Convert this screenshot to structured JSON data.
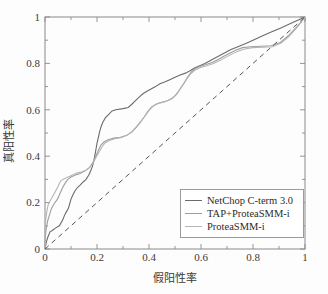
{
  "chart_data": {
    "type": "line",
    "title": "",
    "xlabel": "假阳性率",
    "ylabel": "真阳性率",
    "xlim": [
      0,
      1
    ],
    "ylim": [
      0,
      1
    ],
    "xticks": [
      "0",
      "0.2",
      "0.4",
      "0.6",
      "0.8",
      "1"
    ],
    "xtick_values": [
      0,
      0.2,
      0.4,
      0.6,
      0.8,
      1
    ],
    "yticks": [
      "0",
      "0.2",
      "0.4",
      "0.6",
      "0.8",
      "1"
    ],
    "ytick_values": [
      0,
      0.2,
      0.4,
      0.6,
      0.8,
      1
    ],
    "grid": false,
    "legend_position": "lower-right",
    "series": [
      {
        "name": "NetChop C-term 3.0",
        "color": "#6b6b6b",
        "style": "solid",
        "points": [
          [
            0.0,
            0.0
          ],
          [
            0.005,
            0.03
          ],
          [
            0.012,
            0.055
          ],
          [
            0.02,
            0.075
          ],
          [
            0.028,
            0.08
          ],
          [
            0.04,
            0.09
          ],
          [
            0.055,
            0.1
          ],
          [
            0.068,
            0.125
          ],
          [
            0.075,
            0.145
          ],
          [
            0.082,
            0.16
          ],
          [
            0.09,
            0.175
          ],
          [
            0.095,
            0.195
          ],
          [
            0.1,
            0.215
          ],
          [
            0.108,
            0.235
          ],
          [
            0.115,
            0.25
          ],
          [
            0.125,
            0.265
          ],
          [
            0.135,
            0.275
          ],
          [
            0.148,
            0.29
          ],
          [
            0.158,
            0.3
          ],
          [
            0.168,
            0.318
          ],
          [
            0.175,
            0.335
          ],
          [
            0.182,
            0.355
          ],
          [
            0.188,
            0.38
          ],
          [
            0.192,
            0.405
          ],
          [
            0.196,
            0.43
          ],
          [
            0.2,
            0.455
          ],
          [
            0.205,
            0.48
          ],
          [
            0.21,
            0.505
          ],
          [
            0.215,
            0.525
          ],
          [
            0.222,
            0.545
          ],
          [
            0.232,
            0.565
          ],
          [
            0.245,
            0.58
          ],
          [
            0.258,
            0.595
          ],
          [
            0.272,
            0.6
          ],
          [
            0.3,
            0.605
          ],
          [
            0.32,
            0.61
          ],
          [
            0.335,
            0.625
          ],
          [
            0.348,
            0.64
          ],
          [
            0.362,
            0.655
          ],
          [
            0.378,
            0.67
          ],
          [
            0.392,
            0.68
          ],
          [
            0.408,
            0.69
          ],
          [
            0.425,
            0.7
          ],
          [
            0.442,
            0.712
          ],
          [
            0.46,
            0.72
          ],
          [
            0.48,
            0.73
          ],
          [
            0.5,
            0.74
          ],
          [
            0.52,
            0.75
          ],
          [
            0.54,
            0.758
          ],
          [
            0.558,
            0.768
          ],
          [
            0.575,
            0.78
          ],
          [
            0.595,
            0.79
          ],
          [
            0.615,
            0.8
          ],
          [
            0.64,
            0.815
          ],
          [
            0.665,
            0.83
          ],
          [
            0.69,
            0.845
          ],
          [
            0.715,
            0.86
          ],
          [
            0.742,
            0.872
          ],
          [
            0.77,
            0.885
          ],
          [
            0.8,
            0.9
          ],
          [
            0.835,
            0.918
          ],
          [
            0.87,
            0.935
          ],
          [
            0.905,
            0.952
          ],
          [
            0.94,
            0.97
          ],
          [
            0.97,
            0.985
          ],
          [
            1.0,
            1.0
          ]
        ]
      },
      {
        "name": "TAP+ProteaSMM-i",
        "color": "#9e9e9e",
        "style": "solid",
        "points": [
          [
            0.0,
            0.0
          ],
          [
            0.0,
            0.03
          ],
          [
            0.002,
            0.06
          ],
          [
            0.005,
            0.09
          ],
          [
            0.01,
            0.12
          ],
          [
            0.018,
            0.15
          ],
          [
            0.025,
            0.175
          ],
          [
            0.035,
            0.195
          ],
          [
            0.048,
            0.215
          ],
          [
            0.058,
            0.24
          ],
          [
            0.068,
            0.265
          ],
          [
            0.078,
            0.285
          ],
          [
            0.088,
            0.3
          ],
          [
            0.1,
            0.31
          ],
          [
            0.115,
            0.318
          ],
          [
            0.135,
            0.325
          ],
          [
            0.155,
            0.338
          ],
          [
            0.172,
            0.352
          ],
          [
            0.185,
            0.375
          ],
          [
            0.195,
            0.4
          ],
          [
            0.205,
            0.425
          ],
          [
            0.215,
            0.448
          ],
          [
            0.228,
            0.462
          ],
          [
            0.245,
            0.472
          ],
          [
            0.265,
            0.478
          ],
          [
            0.29,
            0.482
          ],
          [
            0.315,
            0.49
          ],
          [
            0.335,
            0.505
          ],
          [
            0.352,
            0.525
          ],
          [
            0.368,
            0.548
          ],
          [
            0.382,
            0.57
          ],
          [
            0.395,
            0.592
          ],
          [
            0.41,
            0.612
          ],
          [
            0.428,
            0.625
          ],
          [
            0.448,
            0.632
          ],
          [
            0.468,
            0.638
          ],
          [
            0.488,
            0.648
          ],
          [
            0.505,
            0.665
          ],
          [
            0.52,
            0.69
          ],
          [
            0.535,
            0.715
          ],
          [
            0.548,
            0.74
          ],
          [
            0.562,
            0.762
          ],
          [
            0.578,
            0.778
          ],
          [
            0.598,
            0.788
          ],
          [
            0.62,
            0.795
          ],
          [
            0.645,
            0.805
          ],
          [
            0.668,
            0.818
          ],
          [
            0.69,
            0.832
          ],
          [
            0.712,
            0.845
          ],
          [
            0.735,
            0.858
          ],
          [
            0.76,
            0.868
          ],
          [
            0.79,
            0.872
          ],
          [
            0.83,
            0.874
          ],
          [
            0.87,
            0.876
          ],
          [
            0.905,
            0.89
          ],
          [
            0.935,
            0.918
          ],
          [
            0.96,
            0.948
          ],
          [
            0.982,
            0.975
          ],
          [
            1.0,
            1.0
          ]
        ]
      },
      {
        "name": "ProteaSMM-i",
        "color": "#b5b5b5",
        "style": "solid",
        "points": [
          [
            0.0,
            0.0
          ],
          [
            0.0,
            0.045
          ],
          [
            0.0,
            0.088
          ],
          [
            0.002,
            0.118
          ],
          [
            0.005,
            0.145
          ],
          [
            0.008,
            0.168
          ],
          [
            0.012,
            0.19
          ],
          [
            0.018,
            0.205
          ],
          [
            0.025,
            0.218
          ],
          [
            0.032,
            0.232
          ],
          [
            0.04,
            0.248
          ],
          [
            0.048,
            0.265
          ],
          [
            0.055,
            0.282
          ],
          [
            0.062,
            0.295
          ],
          [
            0.072,
            0.302
          ],
          [
            0.085,
            0.308
          ],
          [
            0.098,
            0.315
          ],
          [
            0.112,
            0.322
          ],
          [
            0.125,
            0.328
          ],
          [
            0.14,
            0.332
          ],
          [
            0.155,
            0.338
          ],
          [
            0.168,
            0.348
          ],
          [
            0.18,
            0.362
          ],
          [
            0.19,
            0.382
          ],
          [
            0.2,
            0.402
          ],
          [
            0.21,
            0.422
          ],
          [
            0.22,
            0.442
          ],
          [
            0.232,
            0.458
          ],
          [
            0.248,
            0.468
          ],
          [
            0.268,
            0.475
          ],
          [
            0.292,
            0.48
          ],
          [
            0.318,
            0.492
          ],
          [
            0.338,
            0.51
          ],
          [
            0.355,
            0.532
          ],
          [
            0.372,
            0.555
          ],
          [
            0.388,
            0.578
          ],
          [
            0.402,
            0.6
          ],
          [
            0.418,
            0.618
          ],
          [
            0.438,
            0.628
          ],
          [
            0.458,
            0.634
          ],
          [
            0.478,
            0.642
          ],
          [
            0.498,
            0.658
          ],
          [
            0.515,
            0.682
          ],
          [
            0.53,
            0.708
          ],
          [
            0.545,
            0.732
          ],
          [
            0.56,
            0.755
          ],
          [
            0.578,
            0.772
          ],
          [
            0.598,
            0.782
          ],
          [
            0.622,
            0.79
          ],
          [
            0.648,
            0.8
          ],
          [
            0.672,
            0.812
          ],
          [
            0.695,
            0.826
          ],
          [
            0.718,
            0.84
          ],
          [
            0.742,
            0.852
          ],
          [
            0.768,
            0.862
          ],
          [
            0.798,
            0.868
          ],
          [
            0.838,
            0.87
          ],
          [
            0.875,
            0.872
          ],
          [
            0.908,
            0.888
          ],
          [
            0.938,
            0.915
          ],
          [
            0.962,
            0.945
          ],
          [
            0.983,
            0.973
          ],
          [
            1.0,
            1.0
          ]
        ]
      },
      {
        "name": "diagonal-reference",
        "color": "#555555",
        "style": "dashed",
        "points": [
          [
            0.0,
            0.0
          ],
          [
            1.0,
            1.0
          ]
        ]
      }
    ]
  },
  "legend": {
    "entries": [
      {
        "label": "NetChop C-term 3.0",
        "color": "#6b6b6b"
      },
      {
        "label": "TAP+ProteaSMM-i",
        "color": "#9e9e9e"
      },
      {
        "label": "ProteaSMM-i",
        "color": "#b5b5b5"
      }
    ]
  },
  "axes": {
    "x_label": "假阳性率",
    "y_label": "真阳性率",
    "x_tick_labels": [
      "0",
      "0.2",
      "0.4",
      "0.6",
      "0.8",
      "1"
    ],
    "y_tick_labels": [
      "0",
      "0.2",
      "0.4",
      "0.6",
      "0.8",
      "1"
    ],
    "frame_color": "#8a8a8a"
  }
}
